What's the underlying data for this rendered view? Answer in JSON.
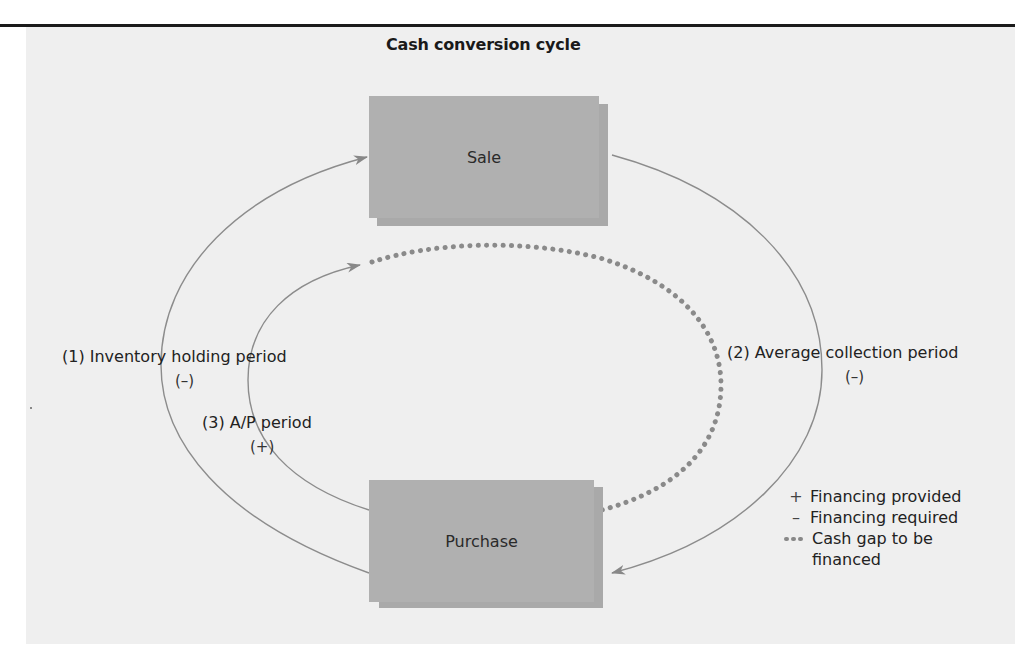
{
  "diagram": {
    "title": "Cash conversion cycle",
    "nodes": {
      "sale": "Sale",
      "purchase": "Purchase"
    },
    "flows": {
      "inventory": {
        "label": "(1) Inventory holding period",
        "sign": "(–)"
      },
      "collection": {
        "label": "(2) Average collection period",
        "sign": "(–)"
      },
      "payables": {
        "label": "(3) A/P period",
        "sign": "(+)"
      }
    },
    "legend": {
      "plus_symbol": "+",
      "plus_label": "Financing provided",
      "minus_symbol": "–",
      "minus_label": "Financing required",
      "gap_label_line1": "Cash gap to be",
      "gap_label_line2": "financed"
    },
    "colors": {
      "panel": "#efefef",
      "box": "#b0b0b0",
      "line": "#888888",
      "dots": "#888888",
      "rule": "#1a1a1a"
    }
  }
}
